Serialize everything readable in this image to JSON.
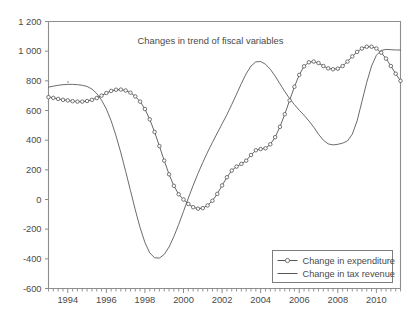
{
  "chart_data": {
    "type": "line",
    "title": "Changes in trend of fiscal variables",
    "xlabel": "",
    "ylabel": "",
    "xlim": [
      1993.0,
      2011.25
    ],
    "ylim": [
      -600,
      1200
    ],
    "grid": false,
    "legend_position": "bottom-right",
    "y_ticks": [
      1200,
      1000,
      800,
      600,
      400,
      200,
      0,
      -200,
      -400,
      -600
    ],
    "y_tick_labels": [
      "1 200",
      "1 000",
      "800",
      "600",
      "400",
      "200",
      "0",
      "-200",
      "-400",
      "-600"
    ],
    "x_ticks": [
      1994,
      1996,
      1998,
      2000,
      2002,
      2004,
      2006,
      2008,
      2010
    ],
    "x_tick_labels": [
      "1994",
      "1996",
      "1998",
      "2000",
      "2002",
      "2004",
      "2006",
      "2008",
      "2010"
    ],
    "x_minor_tick_interval": 0.25,
    "series": [
      {
        "name": "Change in expenditure",
        "marker": "open-circle",
        "x": [
          1993.0,
          1993.25,
          1993.5,
          1993.75,
          1994.0,
          1994.25,
          1994.5,
          1994.75,
          1995.0,
          1995.25,
          1995.5,
          1995.75,
          1996.0,
          1996.25,
          1996.5,
          1996.75,
          1997.0,
          1997.25,
          1997.5,
          1997.75,
          1998.0,
          1998.25,
          1998.5,
          1998.75,
          1999.0,
          1999.25,
          1999.5,
          1999.75,
          2000.0,
          2000.25,
          2000.5,
          2000.75,
          2001.0,
          2001.25,
          2001.5,
          2001.75,
          2002.0,
          2002.25,
          2002.5,
          2002.75,
          2003.0,
          2003.25,
          2003.5,
          2003.75,
          2004.0,
          2004.25,
          2004.5,
          2004.75,
          2005.0,
          2005.25,
          2005.5,
          2005.75,
          2006.0,
          2006.25,
          2006.5,
          2006.75,
          2007.0,
          2007.25,
          2007.5,
          2007.75,
          2008.0,
          2008.25,
          2008.5,
          2008.75,
          2009.0,
          2009.25,
          2009.5,
          2009.75,
          2010.0,
          2010.25,
          2010.5,
          2010.75,
          2011.0,
          2011.25
        ],
        "y": [
          690,
          685,
          678,
          672,
          668,
          663,
          660,
          660,
          664,
          672,
          684,
          700,
          718,
          732,
          740,
          741,
          735,
          720,
          695,
          660,
          610,
          540,
          455,
          360,
          262,
          170,
          92,
          35,
          0,
          -30,
          -52,
          -62,
          -58,
          -40,
          -8,
          38,
          95,
          150,
          195,
          222,
          240,
          262,
          300,
          332,
          340,
          345,
          372,
          420,
          490,
          575,
          668,
          760,
          840,
          898,
          925,
          930,
          920,
          900,
          884,
          878,
          882,
          900,
          930,
          965,
          995,
          1018,
          1030,
          1030,
          1018,
          990,
          950,
          900,
          848,
          800
        ]
      },
      {
        "name": "Change in tax revenue",
        "marker": "none",
        "x": [
          1993.0,
          1993.25,
          1993.5,
          1993.75,
          1994.0,
          1994.25,
          1994.5,
          1994.75,
          1995.0,
          1995.25,
          1995.5,
          1995.75,
          1996.0,
          1996.25,
          1996.5,
          1996.75,
          1997.0,
          1997.25,
          1997.5,
          1997.75,
          1998.0,
          1998.25,
          1998.5,
          1998.75,
          1999.0,
          1999.25,
          1999.5,
          1999.75,
          2000.0,
          2000.25,
          2000.5,
          2000.75,
          2001.0,
          2001.25,
          2001.5,
          2001.75,
          2002.0,
          2002.25,
          2002.5,
          2002.75,
          2003.0,
          2003.25,
          2003.5,
          2003.75,
          2004.0,
          2004.25,
          2004.5,
          2004.75,
          2005.0,
          2005.25,
          2005.5,
          2005.75,
          2006.0,
          2006.25,
          2006.5,
          2006.75,
          2007.0,
          2007.25,
          2007.5,
          2007.75,
          2008.0,
          2008.25,
          2008.5,
          2008.75,
          2009.0,
          2009.25,
          2009.5,
          2009.75,
          2010.0,
          2010.25,
          2010.5,
          2010.75,
          2011.0,
          2011.25
        ],
        "y": [
          758,
          764,
          770,
          774,
          776,
          776,
          774,
          770,
          762,
          745,
          715,
          670,
          610,
          530,
          430,
          315,
          190,
          60,
          -70,
          -190,
          -290,
          -360,
          -393,
          -395,
          -370,
          -320,
          -250,
          -168,
          -80,
          10,
          95,
          175,
          250,
          320,
          385,
          448,
          510,
          572,
          640,
          710,
          782,
          848,
          900,
          928,
          930,
          912,
          878,
          832,
          780,
          728,
          680,
          640,
          602,
          568,
          530,
          488,
          440,
          400,
          375,
          368,
          372,
          380,
          395,
          440,
          530,
          660,
          790,
          900,
          972,
          1005,
          1012,
          1010,
          1008,
          1008
        ]
      }
    ]
  },
  "legend": {
    "entries": [
      {
        "label": "Change in expenditure",
        "style": "line-with-circle-marker"
      },
      {
        "label": "Change in tax revenue",
        "style": "plain-line"
      }
    ]
  },
  "colors": {
    "frame": "#8e8e8e",
    "text": "#4a4a4a",
    "series": "#4d4d4d",
    "background": "#ffffff"
  }
}
